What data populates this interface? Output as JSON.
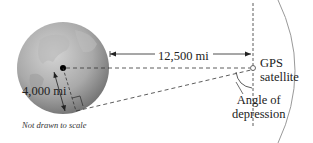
{
  "figure": {
    "labels": {
      "distance": "12,500 mi",
      "radius": "4,000 mi",
      "satellite_line1": "GPS",
      "satellite_line2": "satellite",
      "angle_line1": "Angle of",
      "angle_line2": "depression",
      "note": "Not drawn to scale"
    },
    "colors": {
      "earth_light": "#c9c9c9",
      "earth_dark": "#7a7a7a",
      "line": "#333333",
      "orbit": "#999999"
    }
  }
}
